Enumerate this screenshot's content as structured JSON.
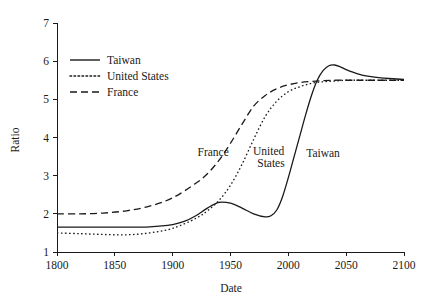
{
  "chart_data": {
    "type": "line",
    "title": "",
    "xlabel": "Date",
    "ylabel": "Ratio",
    "xlim": [
      1800,
      2100
    ],
    "ylim": [
      1,
      7
    ],
    "xticks": [
      1800,
      1850,
      1900,
      1950,
      2000,
      2050,
      2100
    ],
    "yticks": [
      1,
      2,
      3,
      4,
      5,
      6,
      7
    ],
    "grid": false,
    "legend_position": "upper-left-inside",
    "series": [
      {
        "name": "Taiwan",
        "style": "solid",
        "color": "#1a1a1a",
        "x": [
          1800,
          1820,
          1840,
          1860,
          1880,
          1900,
          1910,
          1920,
          1930,
          1940,
          1950,
          1960,
          1970,
          1980,
          1985,
          1990,
          1995,
          2000,
          2005,
          2010,
          2015,
          2020,
          2025,
          2030,
          2035,
          2040,
          2045,
          2050,
          2060,
          2070,
          2080,
          2090,
          2100
        ],
        "y": [
          1.65,
          1.65,
          1.65,
          1.65,
          1.66,
          1.72,
          1.8,
          1.95,
          2.15,
          2.3,
          2.28,
          2.15,
          2.0,
          1.92,
          1.95,
          2.1,
          2.45,
          2.95,
          3.5,
          4.05,
          4.6,
          5.1,
          5.5,
          5.75,
          5.88,
          5.9,
          5.85,
          5.78,
          5.67,
          5.6,
          5.56,
          5.54,
          5.52
        ]
      },
      {
        "name": "United States",
        "style": "dotted",
        "color": "#1a1a1a",
        "x": [
          1800,
          1820,
          1840,
          1860,
          1880,
          1900,
          1920,
          1930,
          1940,
          1950,
          1960,
          1970,
          1980,
          1990,
          2000,
          2010,
          2020,
          2030,
          2040,
          2050,
          2060,
          2070,
          2080,
          2090,
          2100
        ],
        "y": [
          1.5,
          1.48,
          1.46,
          1.45,
          1.5,
          1.62,
          1.88,
          2.08,
          2.35,
          2.75,
          3.3,
          3.95,
          4.55,
          4.95,
          5.2,
          5.33,
          5.42,
          5.46,
          5.48,
          5.5,
          5.5,
          5.5,
          5.5,
          5.5,
          5.5
        ]
      },
      {
        "name": "France",
        "style": "dashed",
        "color": "#1a1a1a",
        "x": [
          1800,
          1820,
          1840,
          1860,
          1880,
          1900,
          1920,
          1930,
          1940,
          1950,
          1960,
          1970,
          1980,
          1990,
          2000,
          2010,
          2020,
          2030,
          2040,
          2050,
          2060,
          2070,
          2080,
          2090,
          2100
        ],
        "y": [
          2.0,
          2.0,
          2.02,
          2.08,
          2.2,
          2.42,
          2.8,
          3.05,
          3.4,
          3.85,
          4.35,
          4.82,
          5.1,
          5.28,
          5.38,
          5.44,
          5.47,
          5.49,
          5.5,
          5.5,
          5.5,
          5.5,
          5.5,
          5.5,
          5.5
        ]
      }
    ],
    "legend": [
      {
        "label": "Taiwan",
        "style": "solid"
      },
      {
        "label": "United States",
        "style": "dotted"
      },
      {
        "label": "France",
        "style": "dashed"
      }
    ],
    "annotations": [
      {
        "text": "France",
        "x": 1935,
        "y": 3.52
      },
      {
        "text": "United",
        "x": 1983,
        "y": 3.55
      },
      {
        "text": "States",
        "x": 1985,
        "y": 3.22
      },
      {
        "text": "Taiwan",
        "x": 2030,
        "y": 3.5
      }
    ]
  }
}
